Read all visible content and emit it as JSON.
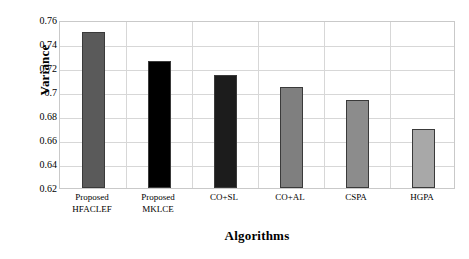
{
  "chart_data": {
    "type": "bar",
    "title": "",
    "xlabel": "Algorithms",
    "ylabel": "Variance",
    "categories": [
      "Proposed HFACLEF",
      "Proposed MKLCE",
      "CO+SL",
      "CO+AL",
      "CSPA",
      "HGPA"
    ],
    "category_lines": [
      [
        "Proposed",
        "HFACLEF"
      ],
      [
        "Proposed",
        "MKLCE"
      ],
      [
        "CO+SL",
        ""
      ],
      [
        "CO+AL",
        ""
      ],
      [
        "CSPA",
        ""
      ],
      [
        "HGPA",
        ""
      ]
    ],
    "values": [
      0.75,
      0.7255,
      0.714,
      0.704,
      0.693,
      0.6695
    ],
    "bar_colors": [
      "#5a5a5a",
      "#000000",
      "#1c1c1c",
      "#7f7f7f",
      "#8c8c8c",
      "#a8a8a8"
    ],
    "ylim": [
      0.62,
      0.76
    ],
    "ytick_labels": [
      "0.76",
      "0.74",
      "0.72",
      "0.7",
      "0.68",
      "0.66",
      "0.64",
      "0.62"
    ],
    "ytick_values": [
      0.76,
      0.74,
      0.72,
      0.7,
      0.68,
      0.66,
      0.64,
      0.62
    ],
    "grid": "horizontal-and-category-separators",
    "legend": "none"
  }
}
